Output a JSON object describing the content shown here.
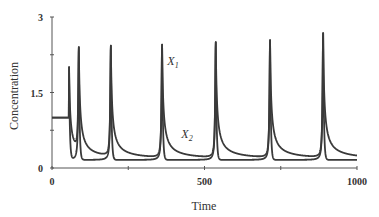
{
  "chart_data": {
    "type": "line",
    "title": "",
    "xlabel": "Time",
    "ylabel": "Concentration",
    "xlim": [
      0,
      1000
    ],
    "ylim": [
      0,
      3
    ],
    "x_ticks": [
      0,
      250,
      500,
      750,
      1000
    ],
    "x_tick_labels": [
      "0",
      "",
      "500",
      "",
      "1000"
    ],
    "y_ticks": [
      0,
      0.75,
      1.5,
      2.25,
      3
    ],
    "y_tick_labels": [
      "0",
      "",
      "1.5",
      "",
      "3"
    ],
    "grid": false,
    "legend": "inline labels",
    "initial_value": 1.0,
    "initial_until": 55,
    "spike_times": [
      56,
      88,
      193,
      361,
      537,
      715,
      889
    ],
    "spike_peaks": [
      2.0,
      2.4,
      2.43,
      2.45,
      2.5,
      2.54,
      2.68
    ],
    "baseline_low": 0.16,
    "series": [
      {
        "name": "X1",
        "label_main": "X",
        "label_sub": "1",
        "label_pos": [
          378,
          2.05
        ],
        "color": "#3a3a3a"
      },
      {
        "name": "X2",
        "label_main": "X",
        "label_sub": "2",
        "label_pos": [
          424,
          0.6
        ],
        "color": "#3a3a3a"
      }
    ],
    "end_value_tail": 0.2
  }
}
